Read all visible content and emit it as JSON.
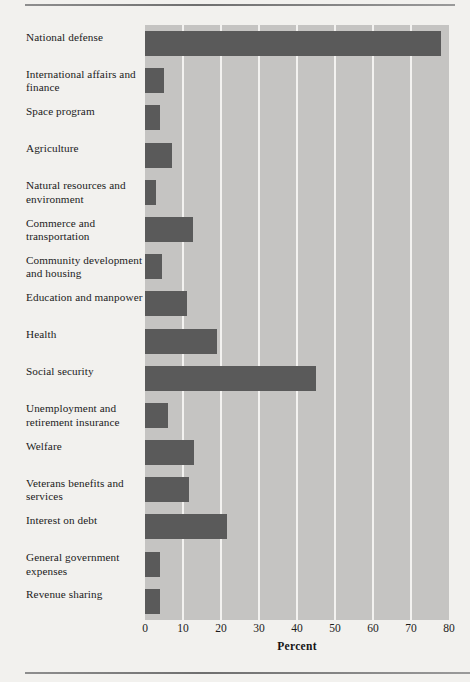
{
  "chart_data": {
    "type": "bar",
    "orientation": "horizontal",
    "title": "",
    "xlabel": "Percent",
    "ylabel": "",
    "xlim": [
      0,
      80
    ],
    "xticks": [
      0,
      10,
      20,
      30,
      40,
      50,
      60,
      70,
      80
    ],
    "grid": true,
    "legend": "none",
    "categories": [
      "National defense",
      "International affairs and finance",
      "Space program",
      "Agriculture",
      "Natural resources and environment",
      "Commerce and transportation",
      "Community development and housing",
      "Education and manpower",
      "Health",
      "Social security",
      "Unemployment and retirement insurance",
      "Welfare",
      "Veterans benefits and services",
      "Interest on debt",
      "General government expenses",
      "Revenue sharing"
    ],
    "values": [
      78,
      5,
      4,
      7,
      3,
      12.5,
      4.5,
      11,
      19,
      45,
      6,
      13,
      11.5,
      21.5,
      4,
      4
    ],
    "series": [
      {
        "name": "Percent",
        "values": [
          78,
          5,
          4,
          7,
          3,
          12.5,
          4.5,
          11,
          19,
          45,
          6,
          13,
          11.5,
          21.5,
          4,
          4
        ]
      }
    ]
  },
  "colors": {
    "bar": "#5a5a5a",
    "plot_background": "#c5c4c2",
    "gridline": "#f3f2f0",
    "page_background": "#f2f1ee",
    "text": "#1b1b1b"
  }
}
